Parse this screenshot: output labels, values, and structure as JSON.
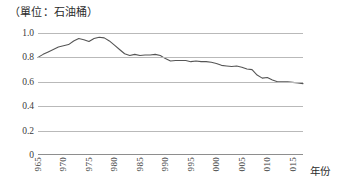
{
  "chart_data": {
    "type": "line",
    "title": "（單位：石油桶）",
    "xlabel": "年份",
    "ylabel": "",
    "xlim": [
      1965,
      2017
    ],
    "ylim": [
      0,
      1.0
    ],
    "grid": true,
    "legend": null,
    "line_color": "#555555",
    "grid_color": "#b9b9b9",
    "y_ticks": [
      "0",
      "0.2",
      "0.4",
      "0.6",
      "0.8",
      "1.0"
    ],
    "y_tick_values": [
      0,
      0.2,
      0.4,
      0.6,
      0.8,
      1.0
    ],
    "x_ticks": [
      "965",
      "970",
      "975",
      "980",
      "985",
      "990",
      "995",
      "000",
      "005",
      "010",
      "015"
    ],
    "x_tick_values": [
      1965,
      1970,
      1975,
      1980,
      1985,
      1990,
      1995,
      2000,
      2005,
      2010,
      2015
    ],
    "x": [
      1965,
      1966,
      1967,
      1968,
      1969,
      1970,
      1971,
      1972,
      1973,
      1974,
      1975,
      1976,
      1977,
      1978,
      1979,
      1980,
      1981,
      1982,
      1983,
      1984,
      1985,
      1986,
      1987,
      1988,
      1989,
      1990,
      1991,
      1992,
      1993,
      1994,
      1995,
      1996,
      1997,
      1998,
      1999,
      2000,
      2001,
      2002,
      2003,
      2004,
      2005,
      2006,
      2007,
      2008,
      2009,
      2010,
      2011,
      2012,
      2013,
      2014,
      2015,
      2016,
      2017
    ],
    "values": [
      0.8,
      0.825,
      0.845,
      0.865,
      0.885,
      0.895,
      0.905,
      0.935,
      0.955,
      0.945,
      0.93,
      0.955,
      0.965,
      0.96,
      0.935,
      0.9,
      0.865,
      0.83,
      0.815,
      0.825,
      0.815,
      0.82,
      0.82,
      0.825,
      0.815,
      0.79,
      0.77,
      0.775,
      0.775,
      0.775,
      0.765,
      0.77,
      0.765,
      0.765,
      0.76,
      0.75,
      0.735,
      0.73,
      0.725,
      0.73,
      0.72,
      0.705,
      0.7,
      0.655,
      0.63,
      0.635,
      0.615,
      0.6,
      0.6,
      0.6,
      0.595,
      0.59,
      0.585
    ]
  }
}
